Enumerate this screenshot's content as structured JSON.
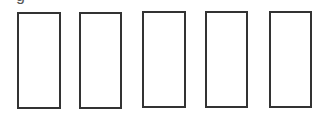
{
  "diagram": {
    "clipped_label": "g",
    "stroke_color": "#333333",
    "boxes": [
      {
        "left": 17,
        "top": 12,
        "width": 44,
        "height": 97
      },
      {
        "left": 79,
        "top": 12,
        "width": 43,
        "height": 97
      },
      {
        "left": 142,
        "top": 11,
        "width": 44,
        "height": 97
      },
      {
        "left": 205,
        "top": 11,
        "width": 43,
        "height": 97
      },
      {
        "left": 269,
        "top": 11,
        "width": 43,
        "height": 97
      }
    ]
  }
}
